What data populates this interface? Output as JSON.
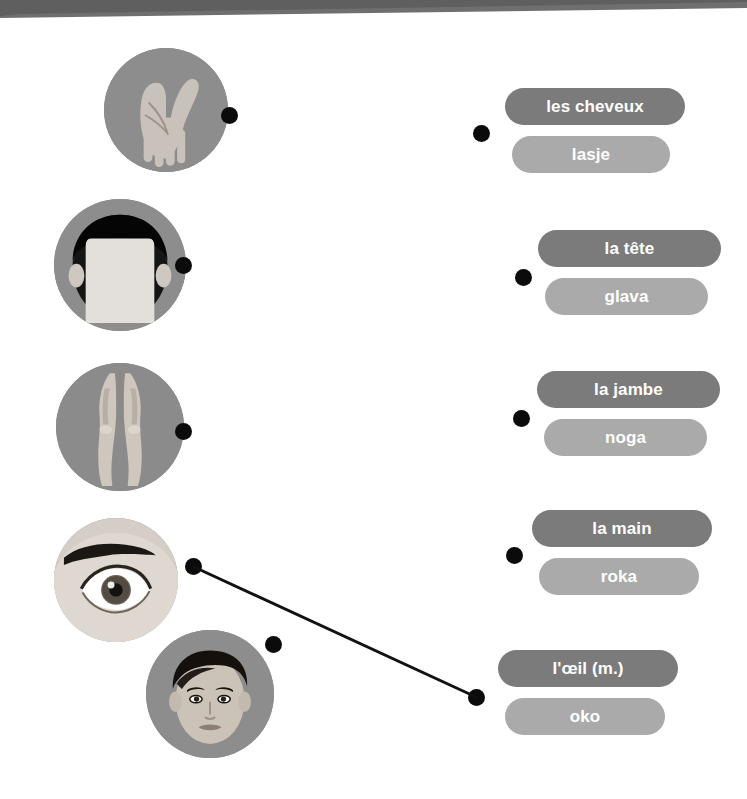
{
  "worksheet": {
    "type": "matching-exercise",
    "background_color": "#ffffff",
    "top_band_color": "#6f6f6f"
  },
  "colors": {
    "pill_french": "#7b7b7b",
    "pill_translation": "#aaaaaa",
    "dot": "#0b0b0b",
    "circle_background": "#8d8d8d",
    "line": "#111111",
    "label_text": "#ffffff"
  },
  "pictures": [
    {
      "id": "hand",
      "icon": "hand-palm-photo",
      "alt": "photograph of an open hand palm",
      "x": 104,
      "y": 48,
      "size": 124,
      "dot": {
        "x": 221,
        "y": 107
      }
    },
    {
      "id": "hair",
      "icon": "hair-head-photo",
      "alt": "photograph of dark hair on a head seen from front",
      "x": 54,
      "y": 199,
      "size": 132,
      "dot": {
        "x": 175,
        "y": 257
      }
    },
    {
      "id": "legs",
      "icon": "legs-photo",
      "alt": "photograph of a pair of legs",
      "x": 56,
      "y": 363,
      "size": 128,
      "dot": {
        "x": 175,
        "y": 423
      }
    },
    {
      "id": "eye",
      "icon": "eye-photo",
      "alt": "photograph of a human eye with eyebrow",
      "x": 54,
      "y": 518,
      "size": 124,
      "dot": {
        "x": 185,
        "y": 558
      }
    },
    {
      "id": "head",
      "icon": "head-face-photo",
      "alt": "illustration of a boy's head and face",
      "x": 146,
      "y": 630,
      "size": 128,
      "dot": {
        "x": 265,
        "y": 636
      }
    }
  ],
  "answers": [
    {
      "id": "cheveux",
      "french": "les cheveux",
      "translation": "lasje",
      "dot": {
        "x": 473,
        "y": 125
      },
      "pill_x": 505,
      "pill_y": 88,
      "pill_width": 180,
      "pill2_x": 512,
      "pill2_y": 136,
      "pill2_width": 158
    },
    {
      "id": "tete",
      "french": "la tête",
      "translation": "glava",
      "dot": {
        "x": 515,
        "y": 269
      },
      "pill_x": 538,
      "pill_y": 230,
      "pill_width": 183,
      "pill2_x": 545,
      "pill2_y": 278,
      "pill2_width": 163
    },
    {
      "id": "jambe",
      "french": "la jambe",
      "translation": "noga",
      "dot": {
        "x": 513,
        "y": 410
      },
      "pill_x": 537,
      "pill_y": 371,
      "pill_width": 183,
      "pill2_x": 544,
      "pill2_y": 419,
      "pill2_width": 163
    },
    {
      "id": "main",
      "french": "la main",
      "translation": "roka",
      "dot": {
        "x": 506,
        "y": 547
      },
      "pill_x": 532,
      "pill_y": 510,
      "pill_width": 180,
      "pill2_x": 539,
      "pill2_y": 558,
      "pill2_width": 160
    },
    {
      "id": "oeil",
      "french": "l'œil (m.)",
      "translation": "oko",
      "dot": {
        "x": 468,
        "y": 689
      },
      "pill_x": 498,
      "pill_y": 650,
      "pill_width": 180,
      "pill2_x": 505,
      "pill2_y": 698,
      "pill2_width": 160
    }
  ],
  "connections": [
    {
      "id": "eye-to-oeil",
      "from": "eye",
      "to": "oeil",
      "x1": 194,
      "y1": 567,
      "x2": 476,
      "y2": 697
    }
  ]
}
